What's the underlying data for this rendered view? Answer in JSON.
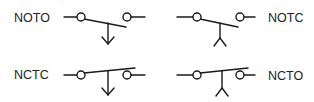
{
  "diagram": {
    "colors": {
      "stroke": "#1a1a1a",
      "text": "#222222",
      "background": "#ffffff"
    },
    "symbols": [
      {
        "id": "noto",
        "label": "NOTO",
        "meaning": "normally open, temperature/actuator held closed",
        "label_side": "left",
        "contact_state": "open",
        "actuator": "arrow"
      },
      {
        "id": "notc",
        "label": "NOTC",
        "label_side": "right",
        "contact_state": "open",
        "actuator": "tripod"
      },
      {
        "id": "nctc",
        "label": "NCTC",
        "label_side": "left",
        "contact_state": "closed",
        "actuator": "arrow"
      },
      {
        "id": "ncto",
        "label": "NCTO",
        "label_side": "right",
        "contact_state": "closed",
        "actuator": "tripod"
      }
    ]
  }
}
